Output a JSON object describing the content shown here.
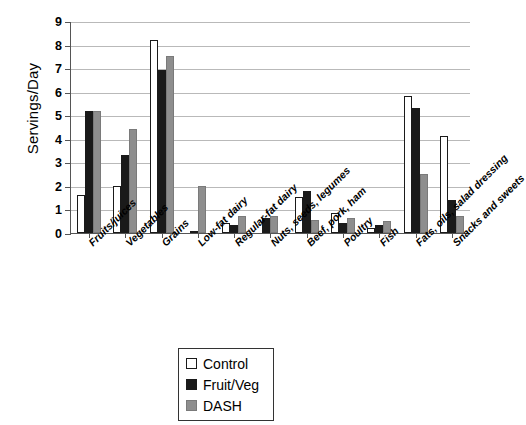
{
  "chart_data": {
    "type": "bar",
    "title": "",
    "xlabel": "",
    "ylabel": "Servings/Day",
    "ylim": [
      0,
      9
    ],
    "ytick_step": 1,
    "yticks": [
      "0",
      "1",
      "2",
      "3",
      "4",
      "5",
      "6",
      "7",
      "8",
      "9"
    ],
    "grid": true,
    "legend_position": "bottom-center",
    "categories": [
      "Fruits/juices",
      "Vegetables",
      "Grains",
      "Low-fat dairy",
      "Regular-fat dairy",
      "Nuts, seeds, legumes",
      "Beef, pork, ham",
      "Poultry",
      "Fish",
      "Fats, oils, salad dressing",
      "Snacks and sweets"
    ],
    "series": [
      {
        "name": "Control",
        "color": "#ffffff",
        "values": [
          1.6,
          2.0,
          8.2,
          0.0,
          0.42,
          0.0,
          1.52,
          0.83,
          0.22,
          5.8,
          4.1
        ]
      },
      {
        "name": "Fruit/Veg",
        "color": "#1a1a1a",
        "values": [
          5.2,
          3.3,
          6.9,
          0.1,
          0.33,
          0.62,
          1.8,
          0.42,
          0.33,
          5.3,
          1.4
        ]
      },
      {
        "name": "DASH",
        "color": "#8e8e8e",
        "values": [
          5.2,
          4.4,
          7.5,
          2.0,
          0.73,
          0.73,
          0.55,
          0.62,
          0.52,
          2.5,
          0.73
        ]
      }
    ]
  }
}
